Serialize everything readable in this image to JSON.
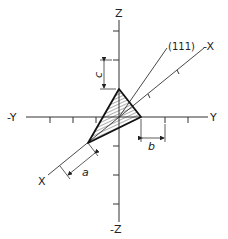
{
  "diagram": {
    "axes": {
      "z_pos": "Z",
      "z_neg": "-Z",
      "y_pos": "Y",
      "y_neg": "-Y",
      "x_pos": "X",
      "x_neg": "-X"
    },
    "plane_label": "(111)",
    "dimensions": {
      "a": "a",
      "b": "b",
      "c": "c"
    }
  }
}
